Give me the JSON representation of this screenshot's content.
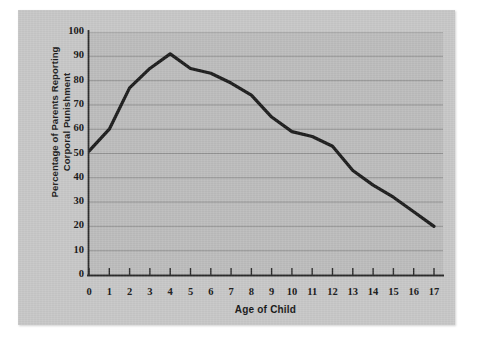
{
  "figure": {
    "card_background": "#c7c7c7",
    "plot_background": "#bcbcbc",
    "line_color": "#1c1c1c",
    "axis_color": "#2b2b2b",
    "grid_color": "#8e8e8e"
  },
  "axes": {
    "y_title": "Percentage of Parents Reporting\nCorporal Punishment",
    "x_title": "Age of Child",
    "y_ticks": [
      0,
      10,
      20,
      30,
      40,
      50,
      60,
      70,
      80,
      90,
      100
    ],
    "x_ticks": [
      0,
      1,
      2,
      3,
      4,
      5,
      6,
      7,
      8,
      9,
      10,
      11,
      12,
      13,
      14,
      15,
      16,
      17
    ]
  },
  "chart_data": {
    "type": "line",
    "title": "",
    "subtitle": "",
    "xlabel": "Age of Child",
    "ylabel": "Percentage of Parents Reporting Corporal Punishment",
    "xlim": [
      0,
      17
    ],
    "ylim": [
      0,
      100
    ],
    "grid": "horizontal",
    "legend": "none",
    "x": [
      0,
      1,
      2,
      3,
      4,
      5,
      6,
      7,
      8,
      9,
      10,
      11,
      12,
      13,
      14,
      15,
      16,
      17
    ],
    "series": [
      {
        "name": "Percentage of parents reporting corporal punishment",
        "values": [
          51,
          60,
          77,
          85,
          91,
          85,
          83,
          79,
          74,
          65,
          59,
          57,
          53,
          43,
          37,
          32,
          26,
          20
        ]
      }
    ]
  }
}
